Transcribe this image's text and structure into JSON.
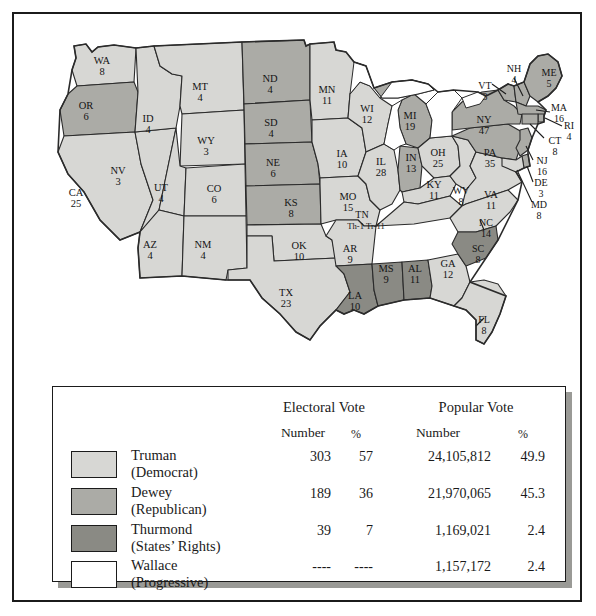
{
  "title_context": "1948 United States presidential election results map",
  "map": {
    "states": [
      {
        "ab": "WA",
        "ev": "8",
        "party": "truman",
        "x": 88,
        "y": 48
      },
      {
        "ab": "OR",
        "ev": "6",
        "party": "dewey",
        "x": 72,
        "y": 93
      },
      {
        "ab": "CA",
        "ev": "25",
        "party": "truman",
        "x": 62,
        "y": 180
      },
      {
        "ab": "NV",
        "ev": "3",
        "party": "truman",
        "x": 104,
        "y": 158
      },
      {
        "ab": "ID",
        "ev": "4",
        "party": "truman",
        "x": 134,
        "y": 106
      },
      {
        "ab": "MT",
        "ev": "4",
        "party": "truman",
        "x": 186,
        "y": 74
      },
      {
        "ab": "WY",
        "ev": "3",
        "party": "truman",
        "x": 192,
        "y": 128
      },
      {
        "ab": "UT",
        "ev": "4",
        "party": "truman",
        "x": 147,
        "y": 175
      },
      {
        "ab": "CO",
        "ev": "6",
        "party": "truman",
        "x": 200,
        "y": 176
      },
      {
        "ab": "AZ",
        "ev": "4",
        "party": "truman",
        "x": 136,
        "y": 232
      },
      {
        "ab": "NM",
        "ev": "4",
        "party": "truman",
        "x": 189,
        "y": 232
      },
      {
        "ab": "ND",
        "ev": "4",
        "party": "dewey",
        "x": 256,
        "y": 66
      },
      {
        "ab": "SD",
        "ev": "4",
        "party": "dewey",
        "x": 257,
        "y": 110
      },
      {
        "ab": "NE",
        "ev": "6",
        "party": "dewey",
        "x": 259,
        "y": 150
      },
      {
        "ab": "KS",
        "ev": "8",
        "party": "dewey",
        "x": 277,
        "y": 190
      },
      {
        "ab": "OK",
        "ev": "10",
        "party": "truman",
        "x": 285,
        "y": 233
      },
      {
        "ab": "TX",
        "ev": "23",
        "party": "truman",
        "x": 272,
        "y": 280
      },
      {
        "ab": "MN",
        "ev": "11",
        "party": "truman",
        "x": 313,
        "y": 77
      },
      {
        "ab": "IA",
        "ev": "10",
        "party": "truman",
        "x": 328,
        "y": 141
      },
      {
        "ab": "MO",
        "ev": "15",
        "party": "truman",
        "x": 334,
        "y": 184
      },
      {
        "ab": "AR",
        "ev": "9",
        "party": "truman",
        "x": 336,
        "y": 236
      },
      {
        "ab": "LA",
        "ev": "10",
        "party": "thurmond",
        "x": 341,
        "y": 283
      },
      {
        "ab": "WI",
        "ev": "12",
        "party": "truman",
        "x": 353,
        "y": 96
      },
      {
        "ab": "IL",
        "ev": "28",
        "party": "truman",
        "x": 367,
        "y": 149
      },
      {
        "ab": "MS",
        "ev": "9",
        "party": "thurmond",
        "x": 372,
        "y": 256
      },
      {
        "ab": "MI",
        "ev": "19",
        "party": "dewey",
        "x": 396,
        "y": 103
      },
      {
        "ab": "IN",
        "ev": "13",
        "party": "dewey",
        "x": 397,
        "y": 145
      },
      {
        "ab": "AL",
        "ev": "11",
        "party": "thurmond",
        "x": 401,
        "y": 256
      },
      {
        "ab": "OH",
        "ev": "25",
        "party": "truman",
        "x": 424,
        "y": 140
      },
      {
        "ab": "KY",
        "ev": "11",
        "party": "truman",
        "x": 420,
        "y": 172
      },
      {
        "ab": "GA",
        "ev": "12",
        "party": "truman",
        "x": 434,
        "y": 251
      },
      {
        "ab": "WV",
        "ev": "8",
        "party": "truman",
        "x": 447,
        "y": 178
      },
      {
        "ab": "VA",
        "ev": "11",
        "party": "truman",
        "x": 477,
        "y": 182
      },
      {
        "ab": "NC",
        "ev": "14",
        "party": "truman",
        "x": 472,
        "y": 210
      },
      {
        "ab": "SC",
        "ev": "8",
        "party": "thurmond",
        "x": 464,
        "y": 236
      },
      {
        "ab": "FL",
        "ev": "8",
        "party": "truman",
        "x": 470,
        "y": 307
      },
      {
        "ab": "PA",
        "ev": "35",
        "party": "dewey",
        "x": 476,
        "y": 140
      },
      {
        "ab": "NY",
        "ev": "47",
        "party": "dewey",
        "x": 470,
        "y": 107
      },
      {
        "ab": "VT",
        "ev": "3",
        "party": "dewey",
        "x": 471,
        "y": 73
      },
      {
        "ab": "NH",
        "ev": "4",
        "party": "dewey",
        "x": 500,
        "y": 56
      },
      {
        "ab": "ME",
        "ev": "5",
        "party": "dewey",
        "x": 535,
        "y": 60
      },
      {
        "ab": "MA",
        "ev": "16",
        "party": "dewey",
        "x": 545,
        "y": 95
      },
      {
        "ab": "RI",
        "ev": "4",
        "party": "dewey",
        "x": 555,
        "y": 113
      },
      {
        "ab": "CT",
        "ev": "8",
        "party": "dewey",
        "x": 541,
        "y": 128
      },
      {
        "ab": "NJ",
        "ev": "16",
        "party": "dewey",
        "x": 528,
        "y": 148
      },
      {
        "ab": "DE",
        "ev": "3",
        "party": "dewey",
        "x": 527,
        "y": 170
      },
      {
        "ab": "MD",
        "ev": "8",
        "party": "truman",
        "x": 525,
        "y": 192
      }
    ],
    "tennessee": {
      "ab": "TN",
      "split_label": "Th-1  Tr-11",
      "thurmond_part": "Th-1",
      "truman_part": "Tr-11"
    }
  },
  "legend": {
    "headers": {
      "electoral_vote": "Electoral Vote",
      "popular_vote": "Popular Vote",
      "number_1": "Number",
      "percent_1": "%",
      "number_2": "Number",
      "percent_2": "%"
    },
    "rows": [
      {
        "candidate": "Truman",
        "party": "(Democrat)",
        "swatch": "truman",
        "electoral_number": "303",
        "electoral_percent": "57",
        "popular_number": "24,105,812",
        "popular_percent": "49.9"
      },
      {
        "candidate": "Dewey",
        "party": "(Republican)",
        "swatch": "dewey",
        "electoral_number": "189",
        "electoral_percent": "36",
        "popular_number": "21,970,065",
        "popular_percent": "45.3"
      },
      {
        "candidate": "Thurmond",
        "party": "(States’ Rights)",
        "swatch": "thurmond",
        "electoral_number": "39",
        "electoral_percent": "7",
        "popular_number": "1,169,021",
        "popular_percent": "2.4"
      },
      {
        "candidate": "Wallace",
        "party": "(Progressive)",
        "swatch": "wallace",
        "electoral_number": "----",
        "electoral_percent": "----",
        "popular_number": "1,157,172",
        "popular_percent": "2.4"
      }
    ]
  },
  "colors": {
    "truman": "#d7d7d4",
    "dewey": "#ababa6",
    "thurmond": "#8a8a84",
    "wallace": "#ffffff",
    "outline": "#2b2b2b",
    "frame": "#1b1b1b",
    "shadow": "#9a9a96"
  }
}
